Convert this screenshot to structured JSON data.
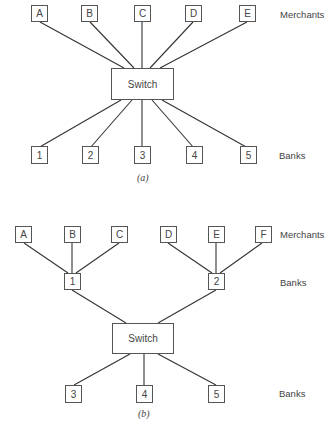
{
  "diagram_a": {
    "caption": "(a)",
    "switch_label": "Switch",
    "merchants": [
      "A",
      "B",
      "C",
      "D",
      "E"
    ],
    "banks": [
      "1",
      "2",
      "3",
      "4",
      "5"
    ],
    "row_labels": {
      "merchants": "Merchants",
      "banks": "Banks"
    }
  },
  "diagram_b": {
    "caption": "(b)",
    "switch_label": "Switch",
    "merchants": [
      "A",
      "B",
      "C",
      "D",
      "E",
      "F"
    ],
    "intermediate_banks": [
      "1",
      "2"
    ],
    "banks": [
      "3",
      "4",
      "5"
    ],
    "row_labels": {
      "merchants": "Merchants",
      "intermediate_banks": "Banks",
      "banks": "Banks"
    }
  },
  "colors": {
    "line": "#333333",
    "box_border": "#555555",
    "text": "#444444"
  }
}
